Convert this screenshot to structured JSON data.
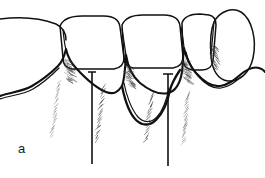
{
  "figure": {
    "panel_label": "a",
    "background_color": "#ffffff",
    "ink_color": "#111111",
    "hatch_color": "#7b7b7b",
    "view_box": "0 0 265 178",
    "width": 265,
    "height": 178
  },
  "teeth": [
    {
      "id": "tooth-1",
      "name": "left-partial-tooth",
      "position": "far-left",
      "crown_path": "M -6 20 C 18 16, 40 18, 56 24 C 62 27, 66 33, 66 40"
    },
    {
      "id": "tooth-2",
      "name": "central-tooth-left",
      "position": "second",
      "crown_path": "M 60 26 C 63 19, 70 16, 82 16 L 104 16 C 114 16, 119 20, 120 27 L 124 58 C 124 64, 120 68, 114 69 L 72 69 C 66 68, 63 64, 63 58 Z"
    },
    {
      "id": "tooth-3",
      "name": "central-tooth-right",
      "position": "third",
      "crown_path": "M 122 25 C 125 18, 132 15, 143 15 L 164 15 C 174 15, 179 19, 180 26 L 183 57 C 183 63, 179 67, 173 68 L 133 68 C 127 67, 124 63, 124 57 Z"
    },
    {
      "id": "tooth-4",
      "name": "lateral-tooth",
      "position": "fourth",
      "crown_path": "M 182 23 C 184 17, 190 14, 200 14 L 209 15 C 214 16, 216 20, 216 25 L 213 61 C 212 67, 208 70, 202 70 L 192 70 C 186 69, 183 65, 183 59 Z"
    },
    {
      "id": "tooth-5",
      "name": "rotated-tooth-right",
      "position": "far-right",
      "crown_path": "M 214 22 C 220 11, 232 7, 241 12 C 252 19, 257 40, 253 58 C 250 72, 240 82, 228 81 C 218 80, 212 70, 211 56 C 210 42, 211 29, 214 22 Z"
    }
  ],
  "gingiva": {
    "name": "gingival-margin",
    "description": "scalloped gum line with interdental papillae",
    "main_path": "M 0 96 C 10 92, 22 92, 32 86 C 44 79, 52 72, 58 66 C 62 62, 64 58, 66 49 C 68 58, 71 63, 76 68 C 86 79, 96 88, 106 92 C 114 95, 118 92, 122 86 C 124 81, 125 72, 126 55 C 128 68, 132 76, 140 83 C 150 91, 160 95, 168 93 C 176 91, 180 84, 182 72 C 183 64, 183 56, 184 48 C 186 58, 190 66, 196 73 C 204 82, 212 87, 220 86 C 228 85, 234 80, 240 75 C 246 70, 252 66, 259 68 C 262 69, 264 70, 265 72",
    "papilla_peaks": [
      {
        "x": 66,
        "y": 49
      },
      {
        "x": 126,
        "y": 55
      },
      {
        "x": 184,
        "y": 48
      }
    ]
  },
  "pocket": {
    "name": "deep-infrabony-pocket",
    "location": "between-central-teeth",
    "outline_path": "M 122 86 C 124 96, 128 112, 136 120 C 142 126, 150 126, 156 120 C 164 112, 168 100, 170 90 C 172 82, 176 76, 180 70",
    "inner_path": "M 124 83 C 126 94, 131 109, 138 117 C 144 123, 151 123, 157 117 C 164 109, 167 98, 169 88"
  },
  "probes": [
    {
      "name": "probe-line-left",
      "x": 92,
      "y_top": 72,
      "y_bottom": 164,
      "has_tick": true,
      "tick_half_width": 4
    },
    {
      "name": "probe-line-right",
      "x": 168,
      "y_top": 74,
      "y_bottom": 166,
      "has_tick": true,
      "tick_half_width": 5
    }
  ],
  "root_hatches": [
    {
      "name": "root-hatch-1",
      "x_top": 59,
      "y_top": 82,
      "x_bottom": 52,
      "y_bottom": 136,
      "density": 22,
      "tone": "light"
    },
    {
      "name": "root-hatch-2",
      "x_top": 104,
      "y_top": 86,
      "x_bottom": 96,
      "y_bottom": 140,
      "density": 24,
      "tone": "medium"
    },
    {
      "name": "root-hatch-3",
      "x_top": 152,
      "y_top": 94,
      "x_bottom": 146,
      "y_bottom": 140,
      "density": 20,
      "tone": "medium"
    },
    {
      "name": "root-hatch-4",
      "x_top": 188,
      "y_top": 94,
      "x_bottom": 184,
      "y_bottom": 142,
      "density": 22,
      "tone": "light"
    }
  ],
  "shading_zones": [
    {
      "name": "shading-papilla-left",
      "cx": 68,
      "cy": 60,
      "angle": 72
    },
    {
      "name": "shading-papilla-mid",
      "cx": 128,
      "cy": 66,
      "angle": 70
    },
    {
      "name": "shading-papilla-right",
      "cx": 186,
      "cy": 60,
      "angle": 74
    },
    {
      "name": "shading-rotated-tooth",
      "cx": 213,
      "cy": 45,
      "angle": 88
    }
  ]
}
